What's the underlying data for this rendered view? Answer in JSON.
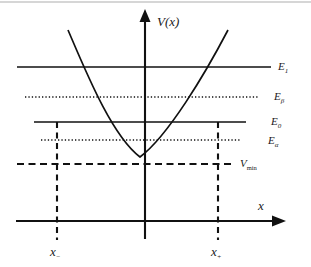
{
  "figure": {
    "name": "potential-energy-well-diagram",
    "background_color": "#ffffff",
    "ink_color": "#111111",
    "width": 311,
    "height": 267
  },
  "axes": {
    "vertical_label": "V(x)",
    "horizontal_label": "x",
    "origin": {
      "x": 145,
      "y": 221
    }
  },
  "curve": {
    "label": "potential-curve",
    "shape": "parabola",
    "vertex": {
      "x": 140,
      "y": 157
    }
  },
  "levels": [
    {
      "key": "E1",
      "label": "E",
      "subscript": "1",
      "style": "solid",
      "y": 67,
      "x_start": 17,
      "x_end": 271,
      "label_x": 278,
      "label_y": 70
    },
    {
      "key": "Ebeta",
      "label": "E",
      "subscript": "β",
      "style": "dotted",
      "y": 97,
      "x_start": 25,
      "x_end": 259,
      "label_x": 274,
      "label_y": 100
    },
    {
      "key": "E0",
      "label": "E",
      "subscript": "0",
      "style": "solid",
      "y": 122,
      "x_start": 34,
      "x_end": 246,
      "label_x": 271,
      "label_y": 125
    },
    {
      "key": "Ealpha",
      "label": "E",
      "subscript": "α",
      "style": "dotted",
      "y": 140,
      "x_start": 41,
      "x_end": 240,
      "label_x": 268,
      "label_y": 144
    },
    {
      "key": "Vmin",
      "label": "V",
      "subscript": "min",
      "style": "dashed",
      "y": 164,
      "x_start": 17,
      "x_end": 232,
      "label_x": 240,
      "label_y": 167
    }
  ],
  "turning_points": [
    {
      "key": "x-minus",
      "label": "x",
      "subscript": "−",
      "x": 57,
      "y_top": 122,
      "y_bottom": 240,
      "label_x": 50,
      "label_y": 256
    },
    {
      "key": "x-plus",
      "label": "x",
      "subscript": "+",
      "x": 218,
      "y_top": 122,
      "y_bottom": 240,
      "label_x": 211,
      "label_y": 256
    }
  ]
}
